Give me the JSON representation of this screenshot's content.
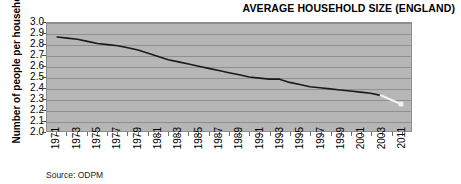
{
  "title": "AVERAGE HOUSEHOLD SIZE (ENGLAND)",
  "y_axis_title": "Number of people per household",
  "source_note": "Source: ODPM",
  "chart_data": {
    "type": "line",
    "title": "AVERAGE HOUSEHOLD SIZE (ENGLAND)",
    "xlabel": "",
    "ylabel": "Number of people per household",
    "ylim": [
      2.0,
      3.0
    ],
    "ytick_step": 0.1,
    "grid": true,
    "legend": "none",
    "background_color": "#b6b6b6",
    "line_color": "#1a1a1a",
    "projection_line_color": "#f2f2f2",
    "ytick_labels": [
      "3.0",
      "2.9",
      "2.8",
      "2.7",
      "2.6",
      "2.5",
      "2.4",
      "2.3",
      "2.2",
      "2.1",
      "2.0"
    ],
    "ytick_values": [
      3.0,
      2.9,
      2.8,
      2.7,
      2.6,
      2.5,
      2.4,
      2.3,
      2.2,
      2.1,
      2.0
    ],
    "xtick_labels": [
      "1971",
      "1973",
      "1975",
      "1977",
      "1979",
      "1981",
      "1983",
      "1985",
      "1987",
      "1989",
      "1991",
      "1993",
      "1995",
      "1997",
      "1999",
      "2001",
      "2003",
      "2011"
    ],
    "x": [
      1971,
      1972,
      1973,
      1974,
      1975,
      1976,
      1977,
      1978,
      1979,
      1980,
      1981,
      1982,
      1983,
      1984,
      1985,
      1986,
      1987,
      1988,
      1989,
      1990,
      1991,
      1992,
      1993,
      1994,
      1995,
      1996,
      1997,
      1998,
      1999,
      2000,
      2001,
      2002,
      2003
    ],
    "values": [
      2.87,
      2.86,
      2.85,
      2.83,
      2.81,
      2.8,
      2.79,
      2.77,
      2.75,
      2.72,
      2.69,
      2.66,
      2.64,
      2.62,
      2.6,
      2.58,
      2.56,
      2.54,
      2.52,
      2.5,
      2.49,
      2.48,
      2.48,
      2.45,
      2.43,
      2.41,
      2.4,
      2.39,
      2.38,
      2.37,
      2.36,
      2.35,
      2.33
    ],
    "projection_x": [
      2003,
      2011
    ],
    "projection_values": [
      2.33,
      2.25
    ],
    "series": [
      {
        "name": "Average household size (actual)",
        "x": [
          1971,
          1972,
          1973,
          1974,
          1975,
          1976,
          1977,
          1978,
          1979,
          1980,
          1981,
          1982,
          1983,
          1984,
          1985,
          1986,
          1987,
          1988,
          1989,
          1990,
          1991,
          1992,
          1993,
          1994,
          1995,
          1996,
          1997,
          1998,
          1999,
          2000,
          2001,
          2002,
          2003
        ],
        "values": [
          2.87,
          2.86,
          2.85,
          2.83,
          2.81,
          2.8,
          2.79,
          2.77,
          2.75,
          2.72,
          2.69,
          2.66,
          2.64,
          2.62,
          2.6,
          2.58,
          2.56,
          2.54,
          2.52,
          2.5,
          2.49,
          2.48,
          2.48,
          2.45,
          2.43,
          2.41,
          2.4,
          2.39,
          2.38,
          2.37,
          2.36,
          2.35,
          2.33
        ],
        "color": "#1a1a1a",
        "style": "solid"
      },
      {
        "name": "Average household size (projection)",
        "x": [
          2003,
          2011
        ],
        "values": [
          2.33,
          2.25
        ],
        "color": "#f2f2f2",
        "style": "solid"
      }
    ]
  }
}
